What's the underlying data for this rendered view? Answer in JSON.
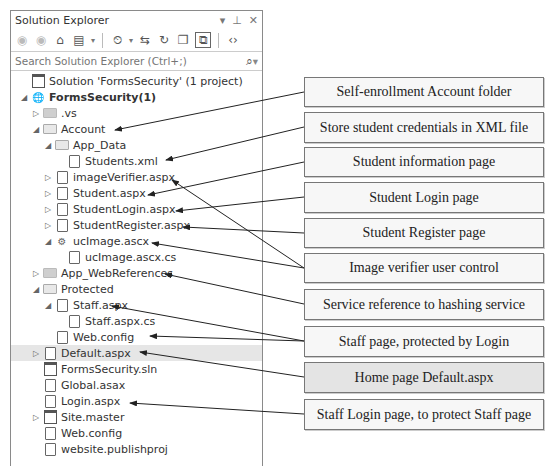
{
  "panel": {
    "title": "Solution Explorer",
    "title_icons": [
      "dropdown-arrow",
      "pin",
      "close"
    ],
    "toolbar": {
      "buttons": [
        "back",
        "forward",
        "home",
        "switch-views",
        "pending-changes-filter",
        "sync-with-active-document",
        "refresh",
        "collapse-all",
        "show-all-files",
        "view-code"
      ]
    },
    "search": {
      "placeholder": "Search Solution Explorer (Ctrl+;)"
    }
  },
  "tree": [
    {
      "label": "Solution 'FormsSecurity' (1 project)",
      "indent": 0,
      "expander": "",
      "icon": "solution",
      "bold": false,
      "y": 0
    },
    {
      "label": "FormsSecurity(1)",
      "indent": 0,
      "expander": "expanded",
      "icon": "web-project",
      "bold": true,
      "y": 16
    },
    {
      "label": ".vs",
      "indent": 1,
      "expander": "collapsed",
      "icon": "folder-dark",
      "bold": false,
      "y": 32
    },
    {
      "label": "Account",
      "indent": 1,
      "expander": "expanded",
      "icon": "folder",
      "bold": false,
      "y": 48
    },
    {
      "label": "App_Data",
      "indent": 2,
      "expander": "expanded",
      "icon": "folder",
      "bold": false,
      "y": 64
    },
    {
      "label": "Students.xml",
      "indent": 3,
      "expander": "",
      "icon": "xml-file",
      "bold": false,
      "y": 80
    },
    {
      "label": "imageVerifier.aspx",
      "indent": 2,
      "expander": "collapsed",
      "icon": "aspx-file",
      "bold": false,
      "y": 96
    },
    {
      "label": "Student.aspx",
      "indent": 2,
      "expander": "collapsed",
      "icon": "aspx-file",
      "bold": false,
      "y": 112
    },
    {
      "label": "StudentLogin.aspx",
      "indent": 2,
      "expander": "collapsed",
      "icon": "aspx-file",
      "bold": false,
      "y": 128
    },
    {
      "label": "StudentRegister.aspx",
      "indent": 2,
      "expander": "collapsed",
      "icon": "aspx-file",
      "bold": false,
      "y": 144
    },
    {
      "label": "ucImage.ascx",
      "indent": 2,
      "expander": "expanded",
      "icon": "user-control",
      "bold": false,
      "y": 160
    },
    {
      "label": "ucImage.ascx.cs",
      "indent": 3,
      "expander": "",
      "icon": "cs-file",
      "bold": false,
      "y": 176
    },
    {
      "label": "App_WebReferences",
      "indent": 1,
      "expander": "collapsed",
      "icon": "folder-dark",
      "bold": false,
      "y": 192
    },
    {
      "label": "Protected",
      "indent": 1,
      "expander": "expanded",
      "icon": "folder",
      "bold": false,
      "y": 208
    },
    {
      "label": "Staff.aspx",
      "indent": 2,
      "expander": "expanded",
      "icon": "aspx-file",
      "bold": false,
      "y": 224
    },
    {
      "label": "Staff.aspx.cs",
      "indent": 3,
      "expander": "",
      "icon": "cs-file",
      "bold": false,
      "y": 240
    },
    {
      "label": "Web.config",
      "indent": 2,
      "expander": "",
      "icon": "config-file",
      "bold": false,
      "y": 256
    },
    {
      "label": "Default.aspx",
      "indent": 1,
      "expander": "collapsed",
      "icon": "aspx-file",
      "bold": false,
      "y": 272,
      "selected": true
    },
    {
      "label": "FormsSecurity.sln",
      "indent": 1,
      "expander": "",
      "icon": "solution",
      "bold": false,
      "y": 288
    },
    {
      "label": "Global.asax",
      "indent": 1,
      "expander": "",
      "icon": "asax-file",
      "bold": false,
      "y": 304
    },
    {
      "label": "Login.aspx",
      "indent": 1,
      "expander": "",
      "icon": "aspx-file",
      "bold": false,
      "y": 320
    },
    {
      "label": "Site.master",
      "indent": 1,
      "expander": "collapsed",
      "icon": "master-file",
      "bold": false,
      "y": 336
    },
    {
      "label": "Web.config",
      "indent": 1,
      "expander": "",
      "icon": "config-file",
      "bold": false,
      "y": 352
    },
    {
      "label": "website.publishproj",
      "indent": 1,
      "expander": "",
      "icon": "publish-file",
      "bold": false,
      "y": 368
    }
  ],
  "callouts": [
    {
      "text": "Self-enrollment Account folder",
      "top": 77,
      "height": 30,
      "highlight": false
    },
    {
      "text": "Store student credentials in XML file",
      "top": 112,
      "height": 31,
      "highlight": false
    },
    {
      "text": "Student information page",
      "top": 147,
      "height": 30,
      "highlight": false
    },
    {
      "text": "Student Login page",
      "top": 182,
      "height": 31,
      "highlight": false
    },
    {
      "text": "Student Register page",
      "top": 218,
      "height": 30,
      "highlight": false
    },
    {
      "text": "Image verifier user control",
      "top": 253,
      "height": 30,
      "highlight": false
    },
    {
      "text": "Service reference to hashing service",
      "top": 289,
      "height": 31,
      "highlight": false
    },
    {
      "text": "Staff page, protected by Login",
      "top": 326,
      "height": 31,
      "highlight": false
    },
    {
      "text": "Home page Default.aspx",
      "top": 362,
      "height": 31,
      "highlight": true
    },
    {
      "text": "Staff Login page, to protect Staff page",
      "top": 399,
      "height": 31,
      "highlight": false
    }
  ],
  "arrows": [
    {
      "from": [
        304,
        92
      ],
      "to": [
        115,
        130
      ]
    },
    {
      "from": [
        304,
        127
      ],
      "to": [
        166,
        160
      ]
    },
    {
      "from": [
        304,
        162
      ],
      "to": [
        148,
        195
      ]
    },
    {
      "from": [
        304,
        197
      ],
      "to": [
        176,
        211
      ]
    },
    {
      "from": [
        304,
        233
      ],
      "to": [
        183,
        227
      ]
    },
    {
      "from": [
        304,
        268
      ],
      "to": [
        172,
        180
      ]
    },
    {
      "from": [
        304,
        268
      ],
      "to": [
        152,
        243
      ]
    },
    {
      "from": [
        304,
        304
      ],
      "to": [
        165,
        274
      ]
    },
    {
      "from": [
        304,
        341
      ],
      "to": [
        112,
        306
      ]
    },
    {
      "from": [
        304,
        341
      ],
      "to": [
        150,
        336
      ]
    },
    {
      "from": [
        304,
        377
      ],
      "to": [
        140,
        352
      ]
    },
    {
      "from": [
        304,
        414
      ],
      "to": [
        130,
        403
      ]
    }
  ]
}
